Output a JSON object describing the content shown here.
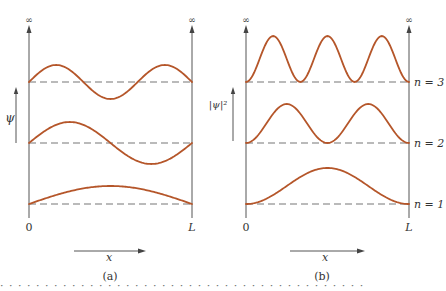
{
  "figure": {
    "curve_color": "#b5562a",
    "axis_color": "#555555",
    "baseline_color": "#777777",
    "infinity_symbol": "∞",
    "panels": [
      {
        "id": "a",
        "caption": "(a)",
        "y_axis_label": "ψ",
        "x_axis_label": "x",
        "x_start_label": "0",
        "x_end_label": "L",
        "quantity": "psi",
        "x_left": 29,
        "x_right": 192,
        "y_axis_arrow_x": 16,
        "x_arrow": {
          "x1": 74,
          "x2": 145,
          "y": 251
        },
        "caption_x": 110,
        "levels": [
          {
            "n": 3,
            "baseline_y": 82,
            "amplitude": 17
          },
          {
            "n": 2,
            "baseline_y": 143,
            "amplitude": 21
          },
          {
            "n": 1,
            "baseline_y": 204,
            "amplitude": 18
          }
        ]
      },
      {
        "id": "b",
        "caption": "(b)",
        "y_axis_label": "|ψ|²",
        "x_axis_label": "x",
        "x_start_label": "0",
        "x_end_label": "L",
        "quantity": "psi_squared",
        "x_left": 246,
        "x_right": 409,
        "y_axis_arrow_x": 233,
        "x_arrow": {
          "x1": 290,
          "x2": 365,
          "y": 251
        },
        "caption_x": 322,
        "levels": [
          {
            "n": 3,
            "baseline_y": 82,
            "amplitude": 46,
            "label": "n = 3"
          },
          {
            "n": 2,
            "baseline_y": 143,
            "amplitude": 39,
            "label": "n = 2"
          },
          {
            "n": 1,
            "baseline_y": 204,
            "amplitude": 36,
            "label": "n = 1"
          }
        ]
      }
    ]
  },
  "cut_off_caption": "· · · · · · · · · · · · · · · · · · · · · · · · · · · · · · · · · · · · · · · · ·"
}
